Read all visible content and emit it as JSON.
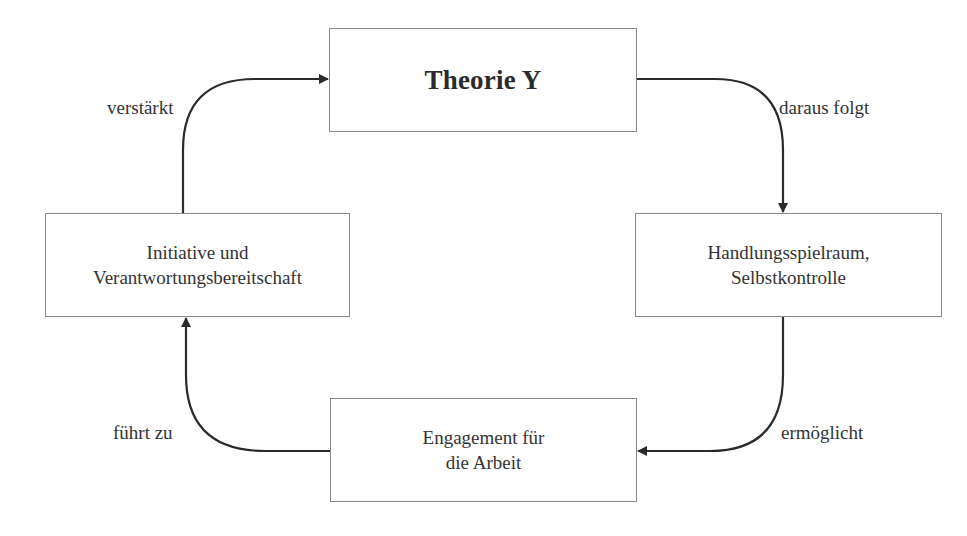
{
  "diagram": {
    "type": "cycle",
    "nodes": [
      {
        "id": "theorie-y",
        "lines": [
          "Theorie Y"
        ]
      },
      {
        "id": "handlungsspielraum",
        "lines": [
          "Handlungsspielraum,",
          "Selbstkontrolle"
        ]
      },
      {
        "id": "engagement",
        "lines": [
          "Engagement für",
          "die Arbeit"
        ]
      },
      {
        "id": "initiative",
        "lines": [
          "Initiative und",
          "Verantwortungsbereitschaft"
        ]
      }
    ],
    "edges": [
      {
        "from": "theorie-y",
        "to": "handlungsspielraum",
        "label": "daraus folgt"
      },
      {
        "from": "handlungsspielraum",
        "to": "engagement",
        "label": "ermöglicht"
      },
      {
        "from": "engagement",
        "to": "initiative",
        "label": "führt zu"
      },
      {
        "from": "initiative",
        "to": "theorie-y",
        "label": "verstärkt"
      }
    ],
    "colors": {
      "stroke": "#2b2b2b",
      "box_border": "#8a8a8a",
      "background": "#ffffff"
    }
  }
}
